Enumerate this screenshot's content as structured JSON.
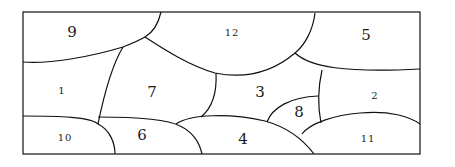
{
  "diagram": {
    "type": "region-partition",
    "regions": [
      {
        "id": "9",
        "label": "9"
      },
      {
        "id": "12",
        "label": "12"
      },
      {
        "id": "5",
        "label": "5"
      },
      {
        "id": "1",
        "label": "1"
      },
      {
        "id": "7",
        "label": "7"
      },
      {
        "id": "3",
        "label": "3"
      },
      {
        "id": "2",
        "label": "2"
      },
      {
        "id": "8",
        "label": "8"
      },
      {
        "id": "10",
        "label": "10"
      },
      {
        "id": "6",
        "label": "6"
      },
      {
        "id": "4",
        "label": "4"
      },
      {
        "id": "11",
        "label": "11"
      }
    ],
    "colors": {
      "stroke": "#111111",
      "background": "#ffffff",
      "text": "#1a1a1a"
    }
  }
}
